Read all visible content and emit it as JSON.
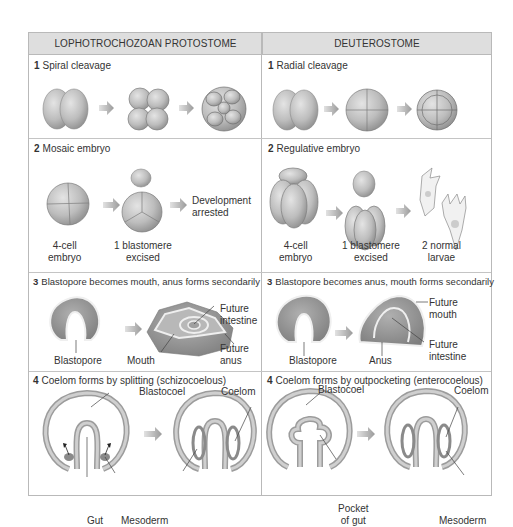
{
  "columns": {
    "left": "LOPHOTROCHOZOAN PROTOSTOME",
    "right": "DEUTEROSTOME"
  },
  "rows": [
    {
      "left": {
        "num": "1",
        "caption": "Spiral cleavage"
      },
      "right": {
        "num": "1",
        "caption": "Radial cleavage"
      }
    },
    {
      "left": {
        "num": "2",
        "caption": "Mosaic embryo",
        "labels": {
          "embryo": "4-cell\nembryo",
          "excised": "1 blastomere\nexcised",
          "result": "Development\narrested"
        }
      },
      "right": {
        "num": "2",
        "caption": "Regulative embryo",
        "labels": {
          "embryo": "4-cell\nembryo",
          "excised": "1 blastomere\nexcised",
          "result": "2 normal\nlarvae"
        }
      }
    },
    {
      "left": {
        "num": "3",
        "caption": "Blastopore becomes mouth, anus forms secondarily",
        "labels": {
          "blastopore": "Blastopore",
          "mouth": "Mouth",
          "future_intestine": "Future\nintestine",
          "future_anus": "Future\nanus"
        }
      },
      "right": {
        "num": "3",
        "caption": "Blastopore becomes anus, mouth forms secondarily",
        "labels": {
          "blastopore": "Blastopore",
          "anus": "Anus",
          "future_mouth": "Future\nmouth",
          "future_intestine": "Future\nintestine"
        }
      }
    },
    {
      "left": {
        "num": "4",
        "caption": "Coelom forms by splitting (schizocoelous)",
        "labels": {
          "blastocoel": "Blastocoel",
          "coelom": "Coelom",
          "gut": "Gut",
          "mesoderm": "Mesoderm"
        }
      },
      "right": {
        "num": "4",
        "caption": "Coelom forms by outpocketing (enterocoelous)",
        "labels": {
          "blastocoel": "Blastocoel",
          "coelom": "Coelom",
          "pocket_of_gut": "Pocket\nof gut",
          "mesoderm": "Mesoderm"
        }
      }
    }
  ],
  "colors": {
    "header_bg": "#dedede",
    "border": "#b9b9b9",
    "cell_fill": "#c9c9c9",
    "cell_shade": "#9e9e9e",
    "arrow": "#a8a8a8",
    "text": "#333333"
  }
}
